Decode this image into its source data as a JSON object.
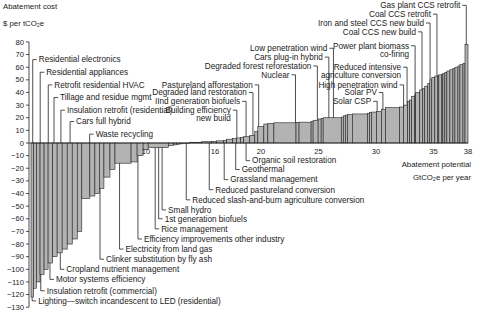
{
  "chart_data": {
    "type": "bar",
    "subtype": "marginal-abatement-cost-curve",
    "ylabel_line1": "Abatement cost",
    "ylabel_line2": "$ per tCO₂e",
    "xlabel_line1": "Abatement potential",
    "xlabel_line2": "GtCO₂e per year",
    "ylim": [
      -130,
      80
    ],
    "xlim": [
      0,
      38
    ],
    "yticks": [
      80,
      70,
      60,
      50,
      40,
      30,
      20,
      10,
      0,
      -10,
      -20,
      -30,
      -40,
      -50,
      -60,
      -70,
      -80,
      -90,
      -100,
      -110,
      -120,
      -130
    ],
    "xticks": [
      10,
      16,
      20,
      25,
      30,
      35,
      38
    ],
    "grid": false,
    "bars": [
      {
        "w": 0.25,
        "v": -122
      },
      {
        "w": 0.3,
        "v": -115
      },
      {
        "w": 0.35,
        "v": -110
      },
      {
        "w": 0.4,
        "v": -104
      },
      {
        "w": 0.4,
        "v": -100
      },
      {
        "w": 0.45,
        "v": -95
      },
      {
        "w": 0.45,
        "v": -90
      },
      {
        "w": 0.5,
        "v": -87
      },
      {
        "w": 0.5,
        "v": -84
      },
      {
        "w": 0.5,
        "v": -80
      },
      {
        "w": 0.5,
        "v": -76
      },
      {
        "w": 0.45,
        "v": -70
      },
      {
        "w": 0.8,
        "v": -44
      },
      {
        "w": 0.5,
        "v": -42
      },
      {
        "w": 0.45,
        "v": -40
      },
      {
        "w": 0.45,
        "v": -36
      },
      {
        "w": 0.6,
        "v": -27
      },
      {
        "w": 0.5,
        "v": -21
      },
      {
        "w": 1.6,
        "v": -16
      },
      {
        "w": 0.6,
        "v": -15
      },
      {
        "w": 0.6,
        "v": -10
      },
      {
        "w": 0.5,
        "v": -5
      },
      {
        "w": 2.0,
        "v": -3.5
      },
      {
        "w": 0.5,
        "v": -2
      },
      {
        "w": 0.3,
        "v": -1.5
      },
      {
        "w": 0.3,
        "v": -1
      },
      {
        "w": 0.3,
        "v": -0.7
      },
      {
        "w": 0.4,
        "v": -0.5
      },
      {
        "w": 0.3,
        "v": -0.3
      },
      {
        "w": 1.2,
        "v": 0.5
      },
      {
        "w": 1.0,
        "v": 1
      },
      {
        "w": 0.5,
        "v": 1.3
      },
      {
        "w": 0.7,
        "v": 1.7
      },
      {
        "w": 0.3,
        "v": 2
      },
      {
        "w": 0.6,
        "v": 3
      },
      {
        "w": 0.4,
        "v": 3.5
      },
      {
        "w": 0.4,
        "v": 4
      },
      {
        "w": 0.3,
        "v": 4.3
      },
      {
        "w": 0.6,
        "v": 5
      },
      {
        "w": 0.5,
        "v": 6
      },
      {
        "w": 0.3,
        "v": 9
      },
      {
        "w": 0.6,
        "v": 13
      },
      {
        "w": 0.4,
        "v": 15
      },
      {
        "w": 0.6,
        "v": 15.5
      },
      {
        "w": 2.2,
        "v": 16
      },
      {
        "w": 0.3,
        "v": 16.3
      },
      {
        "w": 1.2,
        "v": 16.5
      },
      {
        "w": 0.2,
        "v": 17
      },
      {
        "w": 0.5,
        "v": 18
      },
      {
        "w": 0.3,
        "v": 19
      },
      {
        "w": 0.2,
        "v": 19.5
      },
      {
        "w": 1.8,
        "v": 20
      },
      {
        "w": 0.2,
        "v": 20.5
      },
      {
        "w": 0.2,
        "v": 21.5
      },
      {
        "w": 0.2,
        "v": 22
      },
      {
        "w": 0.5,
        "v": 22.5
      },
      {
        "w": 1.5,
        "v": 23
      },
      {
        "w": 0.2,
        "v": 23.5
      },
      {
        "w": 0.2,
        "v": 24
      },
      {
        "w": 0.5,
        "v": 24.5
      },
      {
        "w": 0.5,
        "v": 25
      },
      {
        "w": 0.4,
        "v": 26.5
      },
      {
        "w": 1.4,
        "v": 28
      },
      {
        "w": 0.4,
        "v": 28.5
      },
      {
        "w": 0.4,
        "v": 30
      },
      {
        "w": 0.2,
        "v": 33
      },
      {
        "w": 0.2,
        "v": 34
      },
      {
        "w": 0.3,
        "v": 37
      },
      {
        "w": 0.1,
        "v": 38
      },
      {
        "w": 0.4,
        "v": 40
      },
      {
        "w": 0.3,
        "v": 42
      },
      {
        "w": 0.2,
        "v": 43
      },
      {
        "w": 0.3,
        "v": 45
      },
      {
        "w": 0.2,
        "v": 47
      },
      {
        "w": 0.2,
        "v": 50
      },
      {
        "w": 0.3,
        "v": 52
      },
      {
        "w": 0.3,
        "v": 53
      },
      {
        "w": 0.1,
        "v": 53.5
      },
      {
        "w": 0.3,
        "v": 54
      },
      {
        "w": 0.1,
        "v": 54.5
      },
      {
        "w": 0.2,
        "v": 55
      },
      {
        "w": 0.2,
        "v": 56
      },
      {
        "w": 0.3,
        "v": 57
      },
      {
        "w": 0.3,
        "v": 58
      },
      {
        "w": 0.2,
        "v": 59
      },
      {
        "w": 0.3,
        "v": 60
      },
      {
        "w": 0.2,
        "v": 61
      },
      {
        "w": 0.3,
        "v": 62
      },
      {
        "w": 0.2,
        "v": 63
      },
      {
        "w": 0.3,
        "v": 78
      }
    ],
    "annotations": [
      {
        "text": "Residential electronics",
        "ax": 0.15,
        "av": 66,
        "lv": 66,
        "side": "above"
      },
      {
        "text": "Residential appliances",
        "ax": 0.8,
        "av": 56,
        "lv": 56,
        "side": "above"
      },
      {
        "text": "Retrofit residential HVAC",
        "ax": 1.5,
        "av": 46,
        "lv": 46,
        "side": "above"
      },
      {
        "text": "Tillage and residue mgmt",
        "ax": 2.0,
        "av": 36,
        "lv": 36,
        "side": "above"
      },
      {
        "text": "Insulation retrofit (residential)",
        "ax": 2.6,
        "av": 26,
        "lv": 26,
        "side": "above"
      },
      {
        "text": "Cars full hybrid",
        "ax": 3.4,
        "av": 17,
        "lv": 17,
        "side": "above"
      },
      {
        "text": "Waste recycling",
        "ax": 5.1,
        "av": 7,
        "lv": 7,
        "side": "above"
      },
      {
        "text": "Lighting—switch incandescent to LED (residential)",
        "ax": 0.1,
        "av": -125,
        "lv": -125,
        "side": "below"
      },
      {
        "text": "Insulation retrofit (commercial)",
        "ax": 0.85,
        "av": -117,
        "lv": -117,
        "side": "below"
      },
      {
        "text": "Motor systems efficiency",
        "ax": 1.65,
        "av": -108,
        "lv": -108,
        "side": "below"
      },
      {
        "text": "Cropland nutrient management",
        "ax": 2.55,
        "av": -100,
        "lv": -100,
        "side": "below"
      },
      {
        "text": "Clinker substitution by fly ash",
        "ax": 6.0,
        "av": -92,
        "lv": -92,
        "side": "below"
      },
      {
        "text": "Electricity from land gas",
        "ax": 7.7,
        "av": -84,
        "lv": -84,
        "side": "below"
      },
      {
        "text": "Efficiency improvements other industry",
        "ax": 9.3,
        "av": -76,
        "lv": -76,
        "side": "below"
      },
      {
        "text": "Rice management",
        "ax": 10.8,
        "av": -68,
        "lv": -68,
        "side": "below"
      },
      {
        "text": "1st generation biofuels",
        "ax": 11.1,
        "av": -60,
        "lv": -60,
        "side": "below"
      },
      {
        "text": "Small hydro",
        "ax": 11.4,
        "av": -53,
        "lv": -53,
        "side": "below"
      },
      {
        "text": "Reduced slash-and-burn agriculture conversion",
        "ax": 13.5,
        "av": -45,
        "lv": -45,
        "side": "below"
      },
      {
        "text": "Reduced pastureland conversion",
        "ax": 15.5,
        "av": -37,
        "lv": -37,
        "side": "below"
      },
      {
        "text": "Grassland management",
        "ax": 16.8,
        "av": -29,
        "lv": -29,
        "side": "below"
      },
      {
        "text": "Geothermal",
        "ax": 17.8,
        "av": -21,
        "lv": -21,
        "side": "below"
      },
      {
        "text": "Organic soil restoration",
        "ax": 18.7,
        "av": -14,
        "lv": -14,
        "side": "below"
      },
      {
        "text": "Building efficiency",
        "ax": 17.9,
        "av": 26,
        "lv": 26,
        "side": "left"
      },
      {
        "text": "new build",
        "ax": null,
        "av": 19.5,
        "lv": 19.5,
        "side": "left-cont"
      },
      {
        "text": "IInd generation biofuels",
        "ax": 18.7,
        "av": 33,
        "lv": 33,
        "side": "left"
      },
      {
        "text": "Degraded land restoration",
        "ax": 19.3,
        "av": 40,
        "lv": 40,
        "side": "left"
      },
      {
        "text": "Pastureland afforestation",
        "ax": 19.8,
        "av": 46,
        "lv": 46,
        "side": "left"
      },
      {
        "text": "Nuclear",
        "ax": 23.0,
        "av": 54,
        "lv": 54,
        "side": "left"
      },
      {
        "text": "Degraded forest reforestation",
        "ax": 24.9,
        "av": 61,
        "lv": 61,
        "side": "left"
      },
      {
        "text": "Cars plug-in hybrid",
        "ax": 25.9,
        "av": 68,
        "lv": 68,
        "side": "left"
      },
      {
        "text": "Low penetration wind",
        "ax": 26.3,
        "av": 75,
        "lv": 75,
        "side": "left"
      },
      {
        "text": "Solar CSP",
        "ax": 30.1,
        "av": 33,
        "lv": 33,
        "side": "left"
      },
      {
        "text": "Solar PV",
        "ax": 30.6,
        "av": 40,
        "lv": 40,
        "side": "left"
      },
      {
        "text": "High penetration wind",
        "ax": 32.4,
        "av": 46,
        "lv": 46,
        "side": "left"
      },
      {
        "text": "Reduced intensive",
        "ax": 32.7,
        "av": 60,
        "lv": 60,
        "side": "left"
      },
      {
        "text": "agriculture conversion",
        "ax": null,
        "av": 53.5,
        "lv": 53.5,
        "side": "left-cont"
      },
      {
        "text": "Power plant biomass",
        "ax": 33.4,
        "av": 77,
        "lv": 77,
        "side": "left"
      },
      {
        "text": "co-firing",
        "ax": null,
        "av": 70.5,
        "lv": 70.5,
        "side": "left-cont"
      },
      {
        "text": "Coal CCS new build",
        "ax": 34.0,
        "av": 88,
        "lv": 88,
        "side": "left"
      },
      {
        "text": "Iron and steel CCS new build",
        "ax": 34.7,
        "av": 95,
        "lv": 95,
        "side": "left"
      },
      {
        "text": "Coal CCS retrofit",
        "ax": 35.3,
        "av": 102,
        "lv": 102,
        "side": "left"
      },
      {
        "text": "Gas plant CCS retrofit",
        "ax": 37.85,
        "av": 109,
        "lv": 109,
        "side": "left"
      }
    ]
  }
}
